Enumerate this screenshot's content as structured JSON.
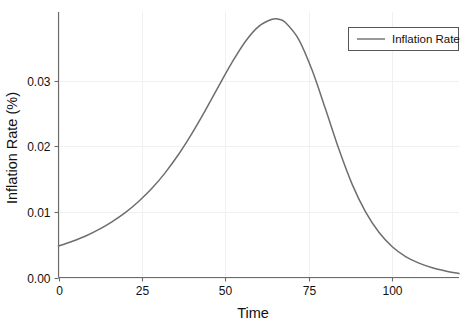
{
  "chart_data": {
    "type": "line",
    "title": "",
    "xlabel": "Time",
    "ylabel": "Inflation Rate (%)",
    "xlim": [
      0,
      120
    ],
    "ylim": [
      0.0,
      0.0405
    ],
    "xticks": [
      0,
      25,
      50,
      75,
      100
    ],
    "xtick_labels": [
      "0",
      "25",
      "50",
      "75",
      "100"
    ],
    "yticks": [
      0.0,
      0.01,
      0.02,
      0.03
    ],
    "ytick_labels": [
      "0.00",
      "0.01",
      "0.02",
      "0.03"
    ],
    "grid": true,
    "grid_color": "#f0f0f0",
    "legend_position": "upper right",
    "line_color": "#6e6e6e",
    "background_color": "#ffffff",
    "text_color": "#111111",
    "series": [
      {
        "name": "Inflation Rate",
        "x": [
          0,
          4,
          8,
          12,
          16,
          20,
          24,
          28,
          32,
          36,
          40,
          44,
          48,
          52,
          56,
          60,
          64,
          66,
          68,
          72,
          76,
          80,
          84,
          88,
          92,
          96,
          100,
          104,
          108,
          112,
          116,
          120
        ],
        "values": [
          0.0048,
          0.0055,
          0.0063,
          0.0073,
          0.0085,
          0.0099,
          0.0116,
          0.0136,
          0.016,
          0.0188,
          0.022,
          0.0255,
          0.0292,
          0.0328,
          0.036,
          0.0383,
          0.0394,
          0.0394,
          0.0389,
          0.0363,
          0.0316,
          0.0257,
          0.0196,
          0.0142,
          0.01,
          0.0069,
          0.0047,
          0.0032,
          0.0022,
          0.0015,
          0.001,
          0.0006
        ]
      }
    ],
    "legend_entries": [
      {
        "label": "Inflation Rate",
        "color": "#6e6e6e"
      }
    ],
    "annotations": {
      "peak_x": 65,
      "peak_y": 0.0394,
      "start_y": 0.0048,
      "end_y": 0.0006
    }
  }
}
